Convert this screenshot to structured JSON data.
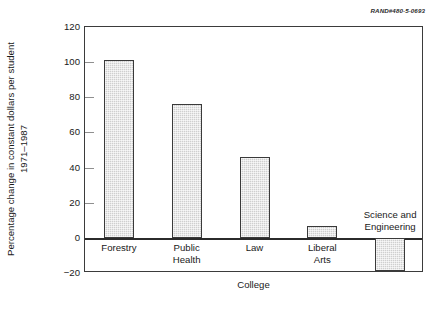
{
  "credit": "RAND#480-5-0693",
  "chart_data": {
    "type": "bar",
    "title": "",
    "xlabel": "College",
    "ylabel": "Percentage change in constant dollars per student",
    "ylabel_line2": "1971–1987",
    "categories": [
      "Forestry",
      "Public Health",
      "Law",
      "Liberal Arts",
      "Science and Engineering"
    ],
    "category_lines": [
      [
        "Forestry"
      ],
      [
        "Public",
        "Health"
      ],
      [
        "Law"
      ],
      [
        "Liberal",
        "Arts"
      ],
      [
        "Science and",
        "Engineering"
      ]
    ],
    "values": [
      101,
      76,
      46,
      7,
      -19
    ],
    "ylim": [
      -20,
      120
    ],
    "yticks": [
      120,
      100,
      80,
      60,
      40,
      20,
      0,
      -20
    ],
    "ytick_labels": [
      "120",
      "100",
      "80",
      "60",
      "40",
      "20",
      "0",
      "−20"
    ],
    "grid": false,
    "legend": "none",
    "bar_fill_color": "#cfcfcf",
    "bar_edge_color": "#3a3a3a",
    "axis_color": "#3b3b3b",
    "zero_line_color": "#2b2b2b"
  }
}
